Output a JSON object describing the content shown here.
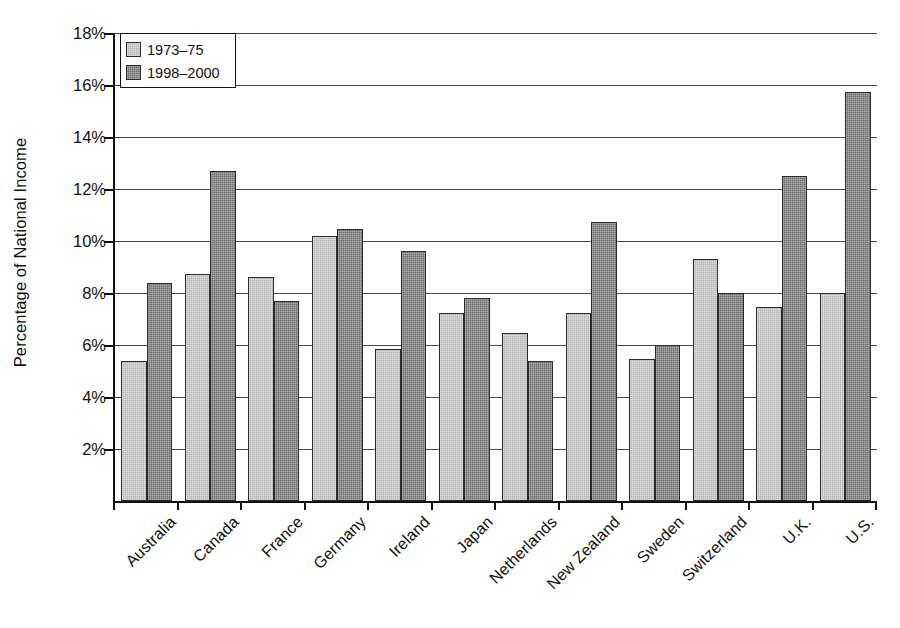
{
  "chart_data": {
    "type": "bar",
    "title": "",
    "xlabel": "",
    "ylabel": "Percentage of National Income",
    "categories": [
      "Australia",
      "Canada",
      "France",
      "Germany",
      "Ireland",
      "Japan",
      "Netherlands",
      "New Zealand",
      "Sweden",
      "Switzerland",
      "U.K.",
      "U.S."
    ],
    "series": [
      {
        "name": "1973–75",
        "color": "#b4b4b4",
        "values": [
          5.4,
          8.75,
          8.6,
          10.2,
          5.85,
          7.25,
          6.45,
          7.25,
          5.45,
          9.3,
          7.45,
          8.0
        ]
      },
      {
        "name": "1998–2000",
        "color": "#6f6f6f",
        "values": [
          8.4,
          12.7,
          7.7,
          10.45,
          9.6,
          7.8,
          5.4,
          10.75,
          6.0,
          8.0,
          12.5,
          15.75
        ]
      }
    ],
    "ylim": [
      0,
      18
    ],
    "ytick_values": [
      2,
      4,
      6,
      8,
      10,
      12,
      14,
      16,
      18
    ],
    "ytick_labels": [
      "2%",
      "4%",
      "6%",
      "8%",
      "10%",
      "12%",
      "14%",
      "16%",
      "18%"
    ],
    "grid": true,
    "grid_axis": "y",
    "legend_position": "top-left",
    "legend_entries": [
      "1973–75",
      "1998–2000"
    ],
    "xtick_label_rotation": 45
  }
}
